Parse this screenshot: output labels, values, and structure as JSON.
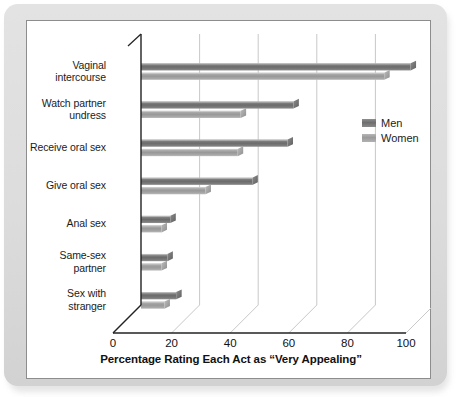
{
  "chart_data": {
    "type": "bar",
    "orientation": "horizontal",
    "title": "",
    "xlabel": "Percentage Rating Each Act as “Very Appealing”",
    "ylabel": "",
    "xlim": [
      0,
      100
    ],
    "xticks": [
      "0",
      "20",
      "40",
      "60",
      "80",
      "100"
    ],
    "grid": true,
    "legend_position": "upper-right",
    "categories": [
      "Vaginal intercourse",
      "Watch partner undress",
      "Receive oral sex",
      "Give oral sex",
      "Anal sex",
      "Same-sex partner",
      "Sex with stranger"
    ],
    "category_lines": [
      [
        "Vaginal",
        "intercourse"
      ],
      [
        "Watch partner",
        "undress"
      ],
      [
        "Receive oral sex"
      ],
      [
        "Give oral sex"
      ],
      [
        "Anal sex"
      ],
      [
        "Same-sex",
        "partner"
      ],
      [
        "Sex with",
        "stranger"
      ]
    ],
    "series": [
      {
        "name": "Men",
        "color": "#757575",
        "values": [
          92,
          52,
          50,
          38,
          10,
          9,
          12
        ]
      },
      {
        "name": "Women",
        "color": "#a5a5a5",
        "values": [
          83,
          34,
          33,
          22,
          7,
          7,
          8
        ]
      }
    ]
  },
  "legend": {
    "items": [
      {
        "label": "Men",
        "swatch": "men-swatch"
      },
      {
        "label": "Women",
        "swatch": "women-swatch"
      }
    ]
  },
  "colors": {
    "men_bar": "#757575",
    "women_bar": "#a5a5a5",
    "panel_background": "#ffffff",
    "mat_background": "#dcdcdc",
    "axis": "#222222",
    "gridline": "#c8c8c8",
    "text": "#1b1b1b"
  }
}
